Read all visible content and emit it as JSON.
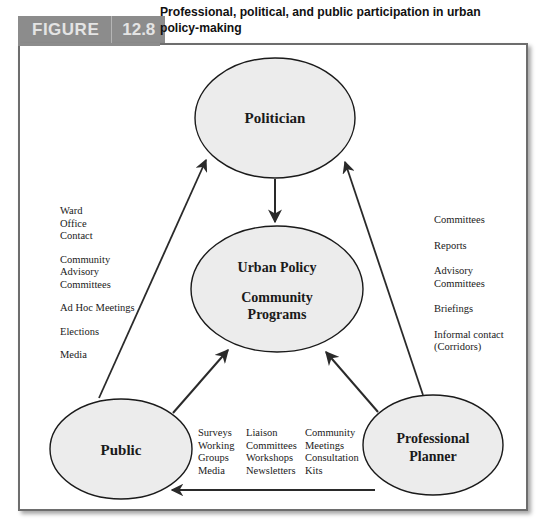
{
  "header": {
    "figure_word": "FIGURE",
    "figure_number": "12.8",
    "title": "Professional, political, and public participation in urban policy-making",
    "tab_color": "#8c8c8c"
  },
  "nodes": {
    "politician": {
      "label": "Politician"
    },
    "center": {
      "line1": "Urban Policy",
      "line2": "Community",
      "line3": "Programs"
    },
    "public": {
      "label": "Public"
    },
    "planner": {
      "line1": "Professional",
      "line2": "Planner"
    }
  },
  "public_to_politician": {
    "items": [
      "Ward",
      "Office",
      "Contact",
      "",
      "Community",
      "Advisory",
      "Committees",
      "",
      "Ad Hoc Meetings",
      "",
      "Elections",
      "",
      "Media"
    ]
  },
  "planner_to_politician": {
    "items": [
      "Committees",
      "",
      "Reports",
      "",
      "Advisory",
      "Committees",
      "",
      "Briefings",
      "",
      "Informal contact",
      "(Corridors)"
    ]
  },
  "planner_to_public": {
    "col1": [
      "Surveys",
      "Working",
      "Groups",
      "Media"
    ],
    "col2": [
      "Liaison",
      "Committees",
      "Workshops",
      "Newsletters"
    ],
    "col3": [
      "Community",
      "Meetings",
      "Consultation",
      "Kits"
    ]
  },
  "arrows": [
    {
      "from": "politician",
      "to": "center"
    },
    {
      "from": "public",
      "to": "politician"
    },
    {
      "from": "planner",
      "to": "politician"
    },
    {
      "from": "public",
      "to": "center"
    },
    {
      "from": "planner",
      "to": "center"
    },
    {
      "from": "planner",
      "to": "public"
    }
  ]
}
